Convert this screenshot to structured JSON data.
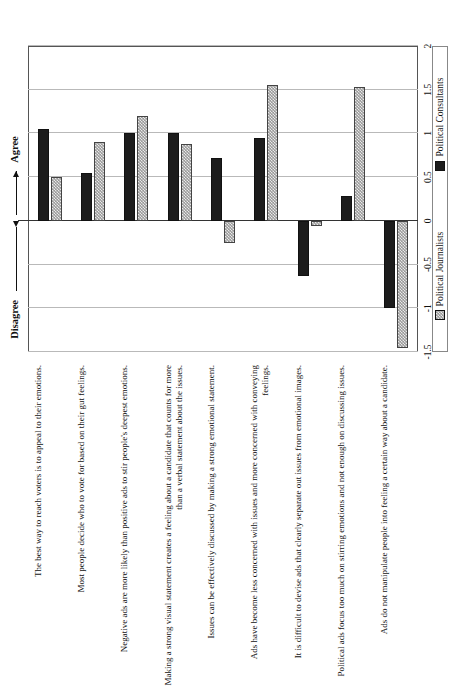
{
  "chart_data": {
    "type": "bar",
    "title": "",
    "orientation": "horizontal",
    "xlabel": "",
    "ylabel": "",
    "xlim": [
      -1.5,
      2
    ],
    "ticks": [
      "-1.5",
      "-1",
      "-0.5",
      "0",
      "0.5",
      "1",
      "1.5",
      "2"
    ],
    "tick_values": [
      -1.5,
      -1,
      -0.5,
      0,
      0.5,
      1,
      1.5,
      2
    ],
    "grid": true,
    "legend_position": "bottom",
    "scale_low_label": "Disagree",
    "scale_high_label": "Agree",
    "categories": [
      "The best way to reach voters is to appeal to their emotions.",
      "Most people decide who to vote for based on their gut feelings.",
      "Negative ads are more likely than positive ads to stir people's deepest emotions.",
      "Making a strong visual statement creates a feeling about a candidate that counts for more than a verbal statement about the issues.",
      "Issues can be effectively discussed by making a strong emotional statement.",
      "Ads have become less concerned with issues and more concerned with conveying feelings.",
      "It is difficult to devise ads that clearly separate out issues from emotional images.",
      "Political ads focus too much on stirring emotions and not enough on discussing issues.",
      "Ads do not manipulate people into feeling a certain way about a candidate."
    ],
    "series": [
      {
        "name": "Political Consultants",
        "color": "#1c1c1c",
        "values": [
          1.05,
          0.55,
          1.0,
          1.0,
          0.72,
          0.95,
          -0.63,
          0.28,
          -1.0
        ]
      },
      {
        "name": "Political Journalists",
        "color": "#9a9a9a",
        "values": [
          0.5,
          0.9,
          1.2,
          0.88,
          -0.25,
          1.55,
          -0.06,
          1.53,
          -1.45
        ]
      }
    ]
  },
  "legend": {
    "items": [
      {
        "label": "Political Journalists",
        "swatch": "journalists"
      },
      {
        "label": "Political Consultants",
        "swatch": "consultants"
      }
    ]
  },
  "annotations": {
    "agree": "Agree",
    "disagree": "Disagree"
  }
}
